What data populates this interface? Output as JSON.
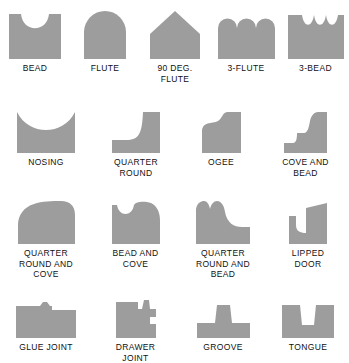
{
  "figure": {
    "shape_fill": "#9d9d9d",
    "background": "#ffffff",
    "caption_color": "#111111"
  },
  "rows": [
    {
      "items": [
        {
          "label": "BEAD",
          "shape": "bead"
        },
        {
          "label": "FLUTE",
          "shape": "flute"
        },
        {
          "label": "90 DEG.\nFLUTE",
          "shape": "flute-90-deg"
        },
        {
          "label": "3-FLUTE",
          "shape": "three-flute"
        },
        {
          "label": "3-BEAD",
          "shape": "three-bead"
        }
      ]
    },
    {
      "items": [
        {
          "label": "NOSING",
          "shape": "nosing"
        },
        {
          "label": "QUARTER\nROUND",
          "shape": "quarter-round"
        },
        {
          "label": "OGEE",
          "shape": "ogee"
        },
        {
          "label": "COVE AND\nBEAD",
          "shape": "cove-and-bead"
        }
      ]
    },
    {
      "items": [
        {
          "label": "QUARTER\nROUND AND\nCOVE",
          "shape": "quarter-round-and-cove"
        },
        {
          "label": "BEAD AND\nCOVE",
          "shape": "bead-and-cove"
        },
        {
          "label": "QUARTER\nROUND AND\nBEAD",
          "shape": "quarter-round-and-bead"
        },
        {
          "label": "LIPPED\nDOOR",
          "shape": "lipped-door"
        }
      ]
    },
    {
      "items": [
        {
          "label": "GLUE JOINT",
          "shape": "glue-joint"
        },
        {
          "label": "DRAWER\nJOINT",
          "shape": "drawer-joint"
        },
        {
          "label": "GROOVE",
          "shape": "groove"
        },
        {
          "label": "TONGUE",
          "shape": "tongue"
        }
      ]
    }
  ]
}
